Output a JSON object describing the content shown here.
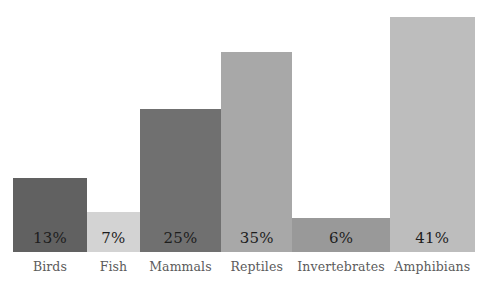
{
  "chart_data": {
    "type": "bar",
    "title": "",
    "subtitle": "",
    "xlabel": "",
    "ylabel": "",
    "ylim": [
      0,
      44
    ],
    "grid": false,
    "legend": "none",
    "orientation": "vertical",
    "value_label_position": "inside-bottom",
    "categories": [
      "Birds",
      "Fish",
      "Mammals",
      "Reptiles",
      "Invertebrates",
      "Amphibians"
    ],
    "values": [
      13,
      7,
      25,
      35,
      6,
      41
    ],
    "value_labels": [
      "13%",
      "7%",
      "25%",
      "35%",
      "6%",
      "41%"
    ],
    "bar_colors": [
      "#616161",
      "#d3d3d3",
      "#707070",
      "#a8a8a8",
      "#999999",
      "#bdbdbd"
    ],
    "bar_width_weights": [
      1.6,
      1.15,
      1.75,
      1.55,
      2.1,
      1.85
    ],
    "background_color": "#ffffff",
    "value_text_color": "#1d1d1d",
    "category_text_color": "#5b5b5b",
    "bars": [
      {
        "category": "Birds",
        "value": 13,
        "value_label": "13%",
        "color": "#616161"
      },
      {
        "category": "Fish",
        "value": 7,
        "value_label": "7%",
        "color": "#d3d3d3"
      },
      {
        "category": "Mammals",
        "value": 25,
        "value_label": "25%",
        "color": "#707070"
      },
      {
        "category": "Reptiles",
        "value": 35,
        "value_label": "35%",
        "color": "#a8a8a8"
      },
      {
        "category": "Invertebrates",
        "value": 6,
        "value_label": "6%",
        "color": "#999999"
      },
      {
        "category": "Amphibians",
        "value": 41,
        "value_label": "41%",
        "color": "#bdbdbd"
      }
    ]
  }
}
